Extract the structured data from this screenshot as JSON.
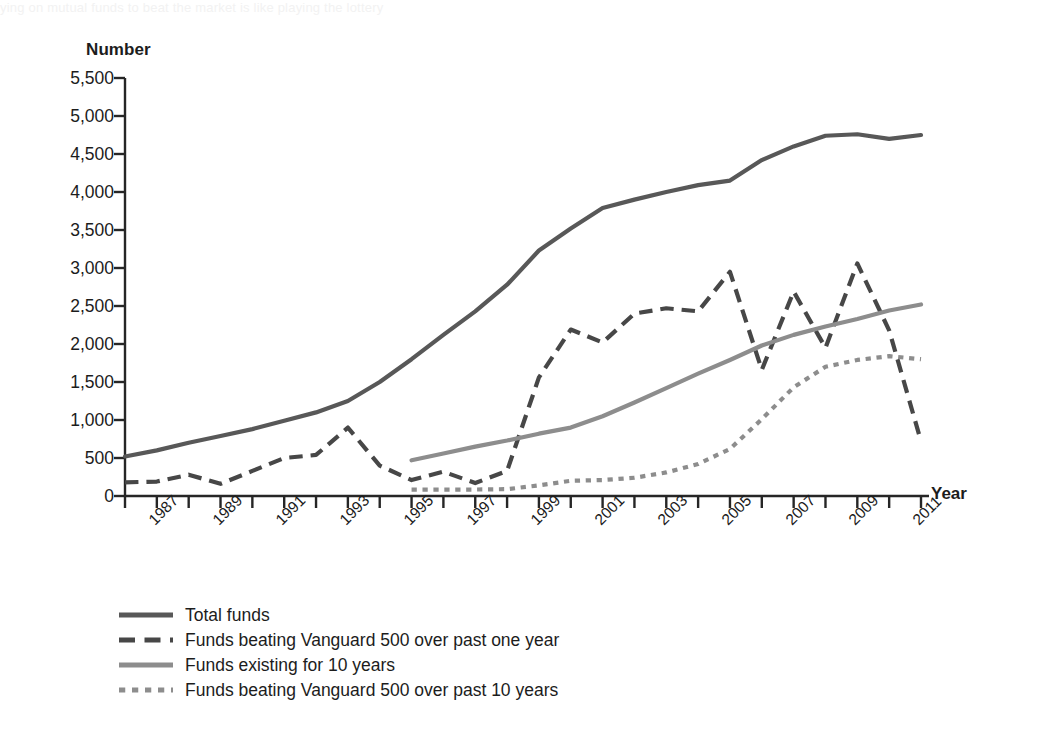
{
  "header": {
    "cut_off_text": "ying on mutual funds to beat the market is like playing the lottery"
  },
  "chart_data": {
    "type": "line",
    "title": "",
    "xlabel": "Year",
    "ylabel": "Number",
    "xlim": [
      1986,
      2011
    ],
    "ylim": [
      0,
      5500
    ],
    "ytick_step": 500,
    "grid": false,
    "legend_position": "below-left",
    "x": [
      1986,
      1987,
      1988,
      1989,
      1990,
      1991,
      1992,
      1993,
      1994,
      1995,
      1996,
      1997,
      1998,
      1999,
      2000,
      2001,
      2002,
      2003,
      2004,
      2005,
      2006,
      2007,
      2008,
      2009,
      2010,
      2011
    ],
    "ytick_labels": [
      "0",
      "500",
      "1,000",
      "1,500",
      "2,000",
      "2,500",
      "3,000",
      "3,500",
      "4,000",
      "4,500",
      "5,000",
      "5,500"
    ],
    "xtick_labels": [
      "1987",
      "1989",
      "1991",
      "1993",
      "1995",
      "1997",
      "1999",
      "2001",
      "2003",
      "2005",
      "2007",
      "2009",
      "2011"
    ],
    "series": [
      {
        "name": "Total funds",
        "style": "solid",
        "color": "#585858",
        "width": 4.2,
        "x": [
          1986,
          1987,
          1988,
          1989,
          1990,
          1991,
          1992,
          1993,
          1994,
          1995,
          1996,
          1997,
          1998,
          1999,
          2000,
          2001,
          2002,
          2003,
          2004,
          2005,
          2006,
          2007,
          2008,
          2009,
          2010,
          2011
        ],
        "values": [
          520,
          600,
          700,
          790,
          880,
          990,
          1100,
          1250,
          1500,
          1800,
          2120,
          2430,
          2780,
          3230,
          3520,
          3790,
          3900,
          4000,
          4090,
          4150,
          4420,
          4600,
          4740,
          4760,
          4700,
          4750
        ]
      },
      {
        "name": "Funds beating Vanguard 500 over past one year",
        "style": "dashed",
        "color": "#474747",
        "width": 4.2,
        "x": [
          1986,
          1987,
          1988,
          1989,
          1990,
          1991,
          1992,
          1993,
          1994,
          1995,
          1996,
          1997,
          1998,
          1999,
          2000,
          2001,
          2002,
          2003,
          2004,
          2005,
          2006,
          2007,
          2008,
          2009,
          2010,
          2011
        ],
        "values": [
          180,
          190,
          280,
          160,
          330,
          500,
          540,
          900,
          400,
          210,
          320,
          170,
          330,
          1560,
          2190,
          2020,
          2400,
          2470,
          2430,
          2950,
          1660,
          2690,
          1950,
          3060,
          2180,
          720
        ]
      },
      {
        "name": "Funds existing for 10 years",
        "style": "solid",
        "color": "#8d8d8d",
        "width": 4.2,
        "x": [
          1995,
          1996,
          1997,
          1998,
          1999,
          2000,
          2001,
          2002,
          2003,
          2004,
          2005,
          2006,
          2007,
          2008,
          2009,
          2010,
          2011
        ],
        "values": [
          470,
          560,
          650,
          730,
          820,
          900,
          1050,
          1230,
          1420,
          1610,
          1790,
          1980,
          2120,
          2230,
          2330,
          2440,
          2520
        ]
      },
      {
        "name": "Funds beating Vanguard 500 over past 10 years",
        "style": "dotted",
        "color": "#8d8d8d",
        "width": 4.2,
        "x": [
          1995,
          1996,
          1997,
          1998,
          1999,
          2000,
          2001,
          2002,
          2003,
          2004,
          2005,
          2006,
          2007,
          2008,
          2009,
          2010,
          2011
        ],
        "values": [
          85,
          85,
          85,
          90,
          140,
          200,
          210,
          240,
          310,
          420,
          620,
          1010,
          1430,
          1700,
          1790,
          1840,
          1800
        ]
      }
    ]
  },
  "legend": {
    "items": [
      {
        "label": "Total funds",
        "style": "solid",
        "color": "#585858"
      },
      {
        "label": "Funds beating Vanguard 500 over past one year",
        "style": "dashed",
        "color": "#474747"
      },
      {
        "label": "Funds existing for 10 years",
        "style": "solid",
        "color": "#8d8d8d"
      },
      {
        "label": "Funds beating Vanguard 500 over past 10 years",
        "style": "dotted",
        "color": "#8d8d8d"
      }
    ]
  }
}
